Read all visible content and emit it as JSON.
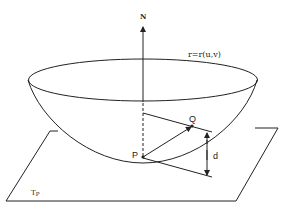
{
  "diagram": {
    "labels": {
      "normal": "N",
      "surface": "r=r(u,v)",
      "point_p": "P",
      "point_q": "Q",
      "distance": "d",
      "tangent_plane": "T",
      "tangent_plane_sub": "P"
    },
    "colors": {
      "stroke": "#222222",
      "background": "#ffffff"
    }
  }
}
